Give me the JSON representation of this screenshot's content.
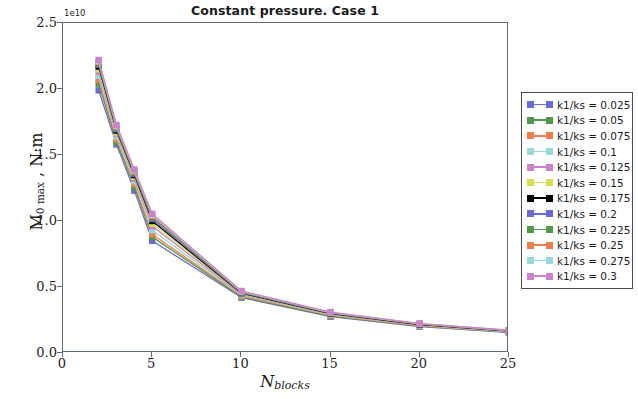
{
  "chart_data": {
    "type": "line",
    "title": "Constant pressure. Case 1",
    "xlabel": "N_blocks",
    "xlabel_main": "N",
    "xlabel_sub": "blocks",
    "ylabel": "M_0 max , N·m",
    "ylabel_main": "M",
    "ylabel_sub": "0 max",
    "ylabel_rest": " , N·m",
    "y_exponent": "1e10",
    "xlim": [
      0,
      25
    ],
    "ylim": [
      0,
      2.5
    ],
    "xticks": [
      "0",
      "5",
      "10",
      "15",
      "20",
      "25"
    ],
    "xtick_values": [
      0,
      5,
      10,
      15,
      20,
      25
    ],
    "yticks": [
      "0.0",
      "0.5",
      "1.0",
      "1.5",
      "2.0",
      "2.5"
    ],
    "ytick_values": [
      0.0,
      0.5,
      1.0,
      1.5,
      2.0,
      2.5
    ],
    "grid": false,
    "legend_position": "right-outside",
    "x": [
      2,
      3,
      4,
      5,
      10,
      15,
      20,
      25
    ],
    "series": [
      {
        "name": "k1/ks = 0.025",
        "color": "#6a6ad6",
        "values": [
          1.99,
          1.58,
          1.23,
          0.85,
          0.42,
          0.275,
          0.2,
          0.155
        ]
      },
      {
        "name": "k1/ks = 0.05",
        "color": "#4f9949",
        "values": [
          2.04,
          1.6,
          1.26,
          0.88,
          0.425,
          0.28,
          0.203,
          0.158
        ]
      },
      {
        "name": "k1/ks = 0.075",
        "color": "#f07d4a",
        "values": [
          2.07,
          1.62,
          1.28,
          0.9,
          0.432,
          0.285,
          0.206,
          0.16
        ]
      },
      {
        "name": "k1/ks = 0.1",
        "color": "#96dada",
        "values": [
          2.1,
          1.64,
          1.3,
          0.93,
          0.438,
          0.289,
          0.209,
          0.162
        ]
      },
      {
        "name": "k1/ks = 0.125",
        "color": "#cc82cc",
        "values": [
          2.13,
          1.66,
          1.32,
          0.96,
          0.444,
          0.293,
          0.212,
          0.164
        ]
      },
      {
        "name": "k1/ks = 0.15",
        "color": "#d6e04f",
        "values": [
          2.15,
          1.67,
          1.335,
          0.98,
          0.449,
          0.296,
          0.214,
          0.166
        ]
      },
      {
        "name": "k1/ks = 0.175",
        "color": "#000000",
        "values": [
          2.17,
          1.685,
          1.348,
          1.0,
          0.453,
          0.299,
          0.216,
          0.167
        ]
      },
      {
        "name": "k1/ks = 0.2",
        "color": "#6a6ad6",
        "values": [
          2.185,
          1.695,
          1.358,
          1.015,
          0.457,
          0.302,
          0.218,
          0.169
        ]
      },
      {
        "name": "k1/ks = 0.225",
        "color": "#4f9949",
        "values": [
          2.195,
          1.705,
          1.367,
          1.028,
          0.461,
          0.304,
          0.22,
          0.17
        ]
      },
      {
        "name": "k1/ks = 0.25",
        "color": "#f07d4a",
        "values": [
          2.205,
          1.713,
          1.375,
          1.038,
          0.464,
          0.306,
          0.221,
          0.171
        ]
      },
      {
        "name": "k1/ks = 0.275",
        "color": "#96dada",
        "values": [
          2.212,
          1.72,
          1.382,
          1.047,
          0.467,
          0.308,
          0.222,
          0.172
        ]
      },
      {
        "name": "k1/ks = 0.3",
        "color": "#cc82cc",
        "values": [
          2.22,
          1.727,
          1.39,
          1.055,
          0.47,
          0.31,
          0.223,
          0.173
        ]
      }
    ]
  },
  "legend": {
    "items": [
      {
        "label": "k1/ks = 0.025",
        "color": "#6a6ad6"
      },
      {
        "label": "k1/ks = 0.05",
        "color": "#4f9949"
      },
      {
        "label": "k1/ks = 0.075",
        "color": "#f07d4a"
      },
      {
        "label": "k1/ks = 0.1",
        "color": "#96dada"
      },
      {
        "label": "k1/ks = 0.125",
        "color": "#cc82cc"
      },
      {
        "label": "k1/ks = 0.15",
        "color": "#d6e04f"
      },
      {
        "label": "k1/ks = 0.175",
        "color": "#000000"
      },
      {
        "label": "k1/ks = 0.2",
        "color": "#6a6ad6"
      },
      {
        "label": "k1/ks = 0.225",
        "color": "#4f9949"
      },
      {
        "label": "k1/ks = 0.25",
        "color": "#f07d4a"
      },
      {
        "label": "k1/ks = 0.275",
        "color": "#96dada"
      },
      {
        "label": "k1/ks = 0.3",
        "color": "#cc82cc"
      }
    ]
  }
}
